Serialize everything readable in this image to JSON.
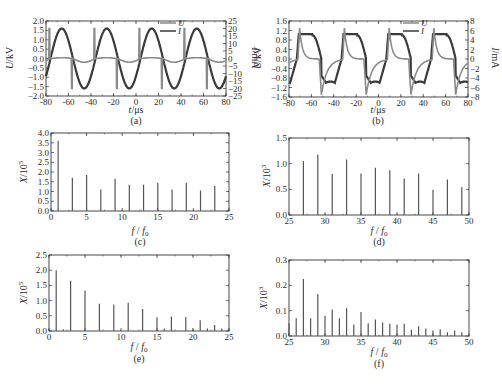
{
  "chart_data": [
    {
      "id": "a",
      "type": "line",
      "caption": "(a)",
      "xlabel": "t/μs",
      "ylabel": "U/kV",
      "y2label": "I/mA",
      "xlim": [
        -80,
        80
      ],
      "ylim": [
        -2.0,
        2.0
      ],
      "y2lim": [
        -25,
        25
      ],
      "xticks": [
        -80,
        -60,
        -40,
        -20,
        0,
        20,
        40,
        60,
        80
      ],
      "yticks": [
        "2.0",
        "1.5",
        "1.0",
        "0.5",
        "0.0",
        "-0.5",
        "-1.0",
        "-1.5",
        "-2.0"
      ],
      "y2ticks": [
        "25",
        "20",
        "15",
        "10",
        "5",
        "0",
        "-5",
        "-10",
        "-15",
        "-20",
        "-25"
      ],
      "legend": [
        "U",
        "I"
      ],
      "series": [
        {
          "name": "U",
          "description": "sinusoidal voltage, amplitude ~1.6 kV, period ~40 μs, peak at -66, -26, 14, 54 μs",
          "amplitude": 1.6,
          "period_us": 40,
          "peak_t_us": -66
        },
        {
          "name": "I",
          "description": "current spikes ~+20/-20 mA near voltage zero-crossings, baseline ~0 with small negative steps",
          "spike_pos_t_us": [
            -77,
            -37,
            3,
            43
          ],
          "spike_neg_t_us": [
            -57,
            -17,
            23,
            63
          ],
          "spike_amp_mA": 20
        }
      ],
      "grid": false
    },
    {
      "id": "b",
      "type": "line",
      "caption": "(b)",
      "xlabel": "t/μs",
      "ylabel": "U/kV",
      "y2label": "I/mA",
      "xlim": [
        -80,
        80
      ],
      "ylim": [
        -1.6,
        1.6
      ],
      "y2lim": [
        -8,
        8
      ],
      "xticks": [
        -80,
        -60,
        -40,
        -20,
        0,
        20,
        40,
        60,
        80
      ],
      "yticks": [
        "1.6",
        "1.2",
        "0.8",
        "0.4",
        "0.0",
        "-0.4",
        "-0.8",
        "-1.2",
        "-1.6"
      ],
      "y2ticks": [
        "8",
        "6",
        "4",
        "2",
        "0",
        "-2",
        "-4",
        "-6",
        "-8"
      ],
      "legend": [
        "U",
        "I"
      ],
      "series": [
        {
          "name": "U",
          "description": "distorted square-like voltage, plateau ~1.0 kV and ~-1.0 kV, period ~40 μs",
          "plateau": 1.0,
          "period_us": 40
        },
        {
          "name": "I",
          "description": "current pulses ~+6.5 mA at rising edge and ~-7.5 mA at falling edge, exponential decay",
          "spike_pos_t_us": [
            -72,
            -32,
            8,
            48
          ],
          "spike_neg_t_us": [
            -51,
            -11,
            29,
            69
          ]
        }
      ],
      "grid": false
    },
    {
      "id": "c",
      "type": "bar",
      "caption": "(c)",
      "xlabel": "f / f0",
      "ylabel": "X/10^5",
      "xlim": [
        0,
        25
      ],
      "ylim": [
        0,
        4.0
      ],
      "xticks": [
        0,
        5,
        10,
        15,
        20,
        25
      ],
      "yticks": [
        "4.0",
        "3.5",
        "3.0",
        "2.5",
        "2.0",
        "1.5",
        "1.0",
        "0.5",
        "0.0"
      ],
      "x": [
        1,
        3,
        5,
        7,
        9,
        11,
        13,
        15,
        17,
        19,
        21,
        23
      ],
      "values": [
        3.6,
        1.7,
        1.85,
        1.1,
        1.65,
        1.35,
        1.35,
        1.45,
        1.1,
        1.45,
        1.05,
        1.3
      ]
    },
    {
      "id": "d",
      "type": "bar",
      "caption": "(d)",
      "xlabel": "f / f0",
      "ylabel": "X/10^3",
      "xlim": [
        25,
        50
      ],
      "ylim": [
        0,
        1.5
      ],
      "xticks": [
        25,
        30,
        35,
        40,
        45,
        50
      ],
      "yticks": [
        "1.5",
        "1.0",
        "0.5",
        "0.0"
      ],
      "x": [
        27,
        29,
        31,
        33,
        35,
        37,
        39,
        41,
        43,
        45,
        47,
        49
      ],
      "values": [
        1.05,
        1.18,
        0.8,
        1.08,
        0.81,
        0.92,
        0.87,
        0.71,
        0.81,
        0.49,
        0.69,
        0.54
      ]
    },
    {
      "id": "e",
      "type": "bar",
      "caption": "(e)",
      "xlabel": "f / f0",
      "ylabel": "X/10^5",
      "xlim": [
        0,
        25
      ],
      "ylim": [
        0,
        2.5
      ],
      "xticks": [
        0,
        5,
        10,
        15,
        20,
        25
      ],
      "yticks": [
        "2.5",
        "2.0",
        "1.5",
        "1.0",
        "0.5",
        "0.0"
      ],
      "x": [
        1,
        2,
        3,
        5,
        7,
        9,
        11,
        13,
        15,
        16,
        17,
        19,
        20,
        21,
        22,
        23,
        24
      ],
      "values": [
        2.0,
        0.05,
        1.65,
        1.33,
        0.9,
        0.87,
        0.93,
        0.72,
        0.45,
        0.08,
        0.48,
        0.46,
        0.07,
        0.35,
        0.08,
        0.2,
        0.08
      ]
    },
    {
      "id": "f",
      "type": "bar",
      "caption": "(f)",
      "xlabel": "f / f0",
      "ylabel": "X/10^3",
      "xlim": [
        25,
        50
      ],
      "ylim": [
        0,
        0.3
      ],
      "xticks": [
        25,
        30,
        35,
        40,
        45,
        50
      ],
      "yticks": [
        "0.3",
        "0.2",
        "0.1",
        "0.0"
      ],
      "x": [
        25,
        26,
        27,
        28,
        29,
        30,
        31,
        32,
        33,
        34,
        35,
        36,
        37,
        38,
        39,
        40,
        41,
        42,
        43,
        44,
        45,
        46,
        47,
        48,
        49
      ],
      "values": [
        0.05,
        0.07,
        0.225,
        0.07,
        0.165,
        0.08,
        0.105,
        0.07,
        0.11,
        0.045,
        0.095,
        0.05,
        0.065,
        0.053,
        0.048,
        0.045,
        0.048,
        0.025,
        0.038,
        0.03,
        0.022,
        0.027,
        0.015,
        0.022,
        0.015
      ]
    }
  ],
  "labels": {
    "a": {
      "caption": "(a)",
      "xlabel_main": "t",
      "xlabel_unit": "/μs",
      "ylabel_main": "U",
      "ylabel_unit": "/kV",
      "y2label_main": "I",
      "y2label_unit": "/mA",
      "legend_u": "U",
      "legend_i": "I"
    },
    "b": {
      "caption": "(b)",
      "xlabel_main": "t",
      "xlabel_unit": "/μs",
      "ylabel_main": "U",
      "ylabel_unit": "/kV",
      "y2label_main": "I",
      "y2label_unit": "/mA",
      "yleft2_main": "I",
      "yleft2_unit": "/mA",
      "legend_u": "U",
      "legend_i": "I"
    },
    "c": {
      "caption": "(c)",
      "ylabel_main": "X",
      "ylabel_unit": "/10",
      "ylabel_exp": "5",
      "xlabel_f": "f",
      "xlabel_sep": " / ",
      "xlabel_f0": "f",
      "xlabel_sub": "0"
    },
    "d": {
      "caption": "(d)",
      "ylabel_main": "X",
      "ylabel_unit": "/10",
      "ylabel_exp": "3",
      "xlabel_f": "f",
      "xlabel_sep": " / ",
      "xlabel_f0": "f",
      "xlabel_sub": "0"
    },
    "e": {
      "caption": "(e)",
      "ylabel_main": "X",
      "ylabel_unit": "/10",
      "ylabel_exp": "5",
      "xlabel_f": "f",
      "xlabel_sep": " / ",
      "xlabel_f0": "f",
      "xlabel_sub": "0"
    },
    "f": {
      "caption": "(f)",
      "ylabel_main": "X",
      "ylabel_unit": "/10",
      "ylabel_exp": "3",
      "xlabel_f": "f",
      "xlabel_sep": " / ",
      "xlabel_f0": "f",
      "xlabel_sub": "0"
    }
  },
  "colors": {
    "axis": "#333333",
    "voltage": "#3a3a3a",
    "current": "#8a8a8a",
    "bars": "#555555"
  }
}
